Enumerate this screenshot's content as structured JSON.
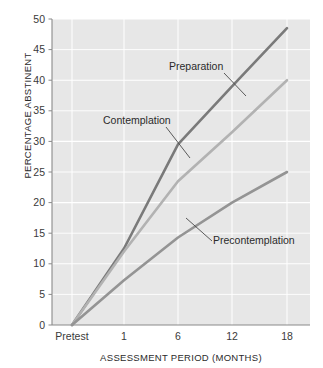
{
  "chart_data": {
    "type": "line",
    "title": "",
    "xlabel": "ASSESSMENT PERIOD (MONTHS)",
    "ylabel": "PERCENTAGE ABSTINENT",
    "categories": [
      "Pretest",
      "1",
      "6",
      "12",
      "18"
    ],
    "x_tick_labels": [
      "Pretest",
      "1",
      "6",
      "12",
      "18"
    ],
    "y_tick_labels": [
      "0",
      "5",
      "10",
      "15",
      "20",
      "25",
      "30",
      "35",
      "40",
      "45",
      "50"
    ],
    "ylim": [
      0,
      50
    ],
    "y_step": 5,
    "grid": true,
    "legend_position": "inline-annotations",
    "series": [
      {
        "name": "Preparation",
        "color": "#7a7a7a",
        "values": [
          0,
          12.5,
          29.5,
          39,
          48.5
        ]
      },
      {
        "name": "Contemplation",
        "color": "#b2b2b2",
        "values": [
          0,
          12,
          23.5,
          31.5,
          40
        ]
      },
      {
        "name": "Precontemplation",
        "color": "#949494",
        "values": [
          0,
          7.3,
          14.3,
          20,
          25
        ]
      }
    ],
    "annotations": [
      {
        "text": "Preparation",
        "series": "Preparation"
      },
      {
        "text": "Contemplation",
        "series": "Contemplation"
      },
      {
        "text": "Precontemplation",
        "series": "Precontemplation"
      }
    ]
  },
  "style": {
    "plot_background": "#e7e7e7",
    "gridline_color": "#ffffff",
    "axis_color": "#8a8a8a",
    "text_color": "#2b2b2b"
  }
}
